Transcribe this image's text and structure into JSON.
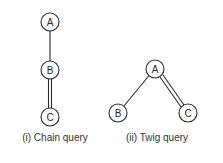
{
  "figures": [
    {
      "id": "chain",
      "caption": "(i) Chain query",
      "nodes": [
        {
          "label": "A",
          "x": 50,
          "y": 22
        },
        {
          "label": "B",
          "x": 50,
          "y": 70
        },
        {
          "label": "C",
          "x": 50,
          "y": 117
        }
      ],
      "edges": [
        {
          "from": "A",
          "to": "B",
          "type": "single"
        },
        {
          "from": "B",
          "to": "C",
          "type": "double"
        }
      ]
    },
    {
      "id": "twig",
      "caption": "(ii) Twig query",
      "nodes": [
        {
          "label": "A",
          "x": 155,
          "y": 69
        },
        {
          "label": "B",
          "x": 118,
          "y": 113
        },
        {
          "label": "C",
          "x": 188,
          "y": 113
        }
      ],
      "edges": [
        {
          "from": "A",
          "to": "B",
          "type": "single"
        },
        {
          "from": "A",
          "to": "C",
          "type": "double"
        }
      ]
    }
  ],
  "style": {
    "stroke_color": "#2a2a2a",
    "node_radius": 9
  }
}
